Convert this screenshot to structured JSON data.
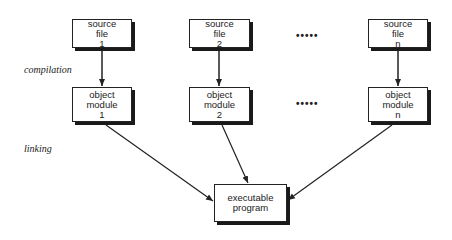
{
  "stages": {
    "compilation": "compilation",
    "linking": "linking"
  },
  "source_files": [
    {
      "line1": "source",
      "line2": "file",
      "line3": "1"
    },
    {
      "line1": "source",
      "line2": "file",
      "line3": "2"
    },
    {
      "line1": "source",
      "line2": "file",
      "line3": "n"
    }
  ],
  "object_modules": [
    {
      "line1": "object",
      "line2": "module",
      "line3": "1"
    },
    {
      "line1": "object",
      "line2": "module",
      "line3": "2"
    },
    {
      "line1": "object",
      "line2": "module",
      "line3": "n"
    }
  ],
  "ellipsis": "•••••",
  "executable": {
    "line1": "executable",
    "line2": "program"
  }
}
